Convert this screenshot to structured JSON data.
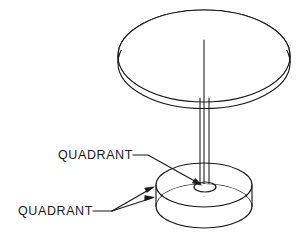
{
  "drawing": {
    "title": "Pedestal table isometric wireframe with quadrant annotations",
    "background_color": "#ffffff",
    "line_color": "#1a1a1a",
    "annotations": [
      {
        "id": "quadrant-top",
        "label": "QUADRANT",
        "text_x": 58,
        "text_y": 159,
        "target": "center hole of base disc"
      },
      {
        "id": "quadrant-bottom",
        "label": "QUADRANT",
        "text_x": 18,
        "text_y": 215,
        "target": "left edge quadrant points of base disc"
      }
    ],
    "geometry": {
      "top_disc": {
        "center_x": 204,
        "center_y": 56,
        "rx": 86,
        "ry": 46,
        "thickness": 8
      },
      "base_disc": {
        "center_x": 204,
        "center_y": 185,
        "rx": 48,
        "ry": 22,
        "thickness": 22
      },
      "center_hole": {
        "center_x": 205,
        "center_y": 187,
        "rx": 11,
        "ry": 5
      },
      "stem": {
        "axis_x": 204,
        "top_y": 40,
        "bottom_y": 196,
        "half_width": 5
      }
    }
  }
}
